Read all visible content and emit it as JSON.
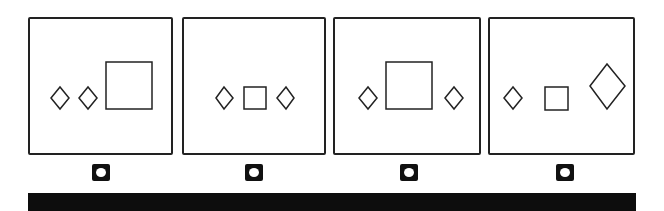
{
  "task": {
    "type": "odd-one-out",
    "options": [
      {
        "id": "option-1",
        "shapes": [
          "diamond",
          "diamond",
          "square-large"
        ]
      },
      {
        "id": "option-2",
        "shapes": [
          "diamond",
          "square-small",
          "diamond"
        ]
      },
      {
        "id": "option-3",
        "shapes": [
          "diamond",
          "square-large",
          "diamond"
        ]
      },
      {
        "id": "option-4",
        "shapes": [
          "diamond",
          "square-small",
          "diamond-large"
        ]
      }
    ]
  },
  "colors": {
    "stroke": "#222222",
    "radio": "#111111",
    "bar": "#0d0d0d"
  }
}
